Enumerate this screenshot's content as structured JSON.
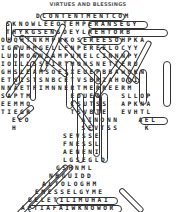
{
  "puzzle": {
    "title": "VIRTUES AND BLESSINGS",
    "type": "word-search",
    "rows": [
      {
        "x": 36,
        "y": 10,
        "text": "DCONTENTMENTCOM"
      },
      {
        "x": 6,
        "y": 18,
        "text": "SKNOWLEEOTEMPERANSEGY"
      },
      {
        "x": 6,
        "y": 26,
        "text": "THYKGSENSOEYLREHTORB"
      },
      {
        "x": 1,
        "y": 34,
        "text": "OHQHTNKMPNKOSEREESOHPKA"
      },
      {
        "x": 1,
        "y": 42,
        "text": "IGWUHMGELLFNPEREELOCYY"
      },
      {
        "x": 1,
        "y": 50,
        "text": "LUOMOWNSAMPUMELCINNNPY"
      },
      {
        "x": 1,
        "y": 58,
        "text": "IOILLSSEIRTMONSNETTERU"
      },
      {
        "x": 1,
        "y": 66,
        "text": "GHSLEAMSOEIXEUEPBBAWOKN"
      },
      {
        "x": 1,
        "y": 74,
        "text": "ETSISTSNBCETVSBRZAHOOI"
      },
      {
        "x": 1,
        "y": 82,
        "text": "NNAETFIMNNERTMERREERM"
      },
      {
        "x": 1,
        "y": 90,
        "text": "SAPTM      EDUES   SLLOP"
      },
      {
        "x": 1,
        "y": 98,
        "text": "EEMMO      ISUTSS  APKNA"
      },
      {
        "x": 1,
        "y": 106,
        "text": "TIEGR      TSVBTE  EVHTL"
      },
      {
        "x": 12,
        "y": 114,
        "text": "ECO        AINONN   AEL"
      },
      {
        "x": 12,
        "y": 122,
        "text": "H          SEVTSS    K"
      },
      {
        "x": 63,
        "y": 130,
        "text": "SEVSSE"
      },
      {
        "x": 63,
        "y": 138,
        "text": "FNESSL"
      },
      {
        "x": 63,
        "y": 146,
        "text": "AENENI"
      },
      {
        "x": 63,
        "y": 154,
        "text": "LGSEGLD"
      },
      {
        "x": 56,
        "y": 162,
        "text": "GSHNML"
      },
      {
        "x": 49,
        "y": 170,
        "text": "NBGUIDD"
      },
      {
        "x": 42,
        "y": 178,
        "text": "ALTOLOGHM"
      },
      {
        "x": 35,
        "y": 186,
        "text": "EMESSELGYME"
      },
      {
        "x": 28,
        "y": 194,
        "text": "BELETILIMUHAI"
      },
      {
        "x": 21,
        "y": 202,
        "text": "ACTIAFAIWKNOWOR"
      },
      {
        "x": 14,
        "y": 210,
        "text": "STRAEHECNAREPMETF"
      }
    ],
    "found_words": [
      "CONTENTMENT",
      "TEMPERANCE",
      "KNOWLEDGE",
      "BROTHERLY",
      "HUMILITY",
      "TEMPERANCE",
      "KINDNESS",
      "GENEROSITY",
      "PATIENCE",
      "FAITH",
      "VIRTUE",
      "GOODNESS",
      "SELFLESSNESS",
      "WISDOM",
      "HEART",
      "MEEKNESS",
      "HOLINESS",
      "LOVE"
    ],
    "rings": [
      {
        "x": 40,
        "y": 10,
        "w": 85,
        "h": 8
      },
      {
        "x": 6,
        "y": 18,
        "w": 6,
        "h": 22
      },
      {
        "x": 88,
        "y": 18,
        "w": 60,
        "h": 8
      },
      {
        "x": 12,
        "y": 26,
        "w": 45,
        "h": 8
      },
      {
        "x": 88,
        "y": 26,
        "w": 80,
        "h": 8
      },
      {
        "x": 80,
        "y": 34,
        "w": 42,
        "h": 8
      },
      {
        "x": 66,
        "y": 58,
        "w": 7,
        "h": 48
      },
      {
        "x": 94,
        "y": 66,
        "w": 7,
        "h": 46
      },
      {
        "x": 163,
        "y": 58,
        "w": 8,
        "h": 46
      },
      {
        "x": 139,
        "y": 66,
        "w": 8,
        "h": 36
      },
      {
        "x": 13,
        "y": 42,
        "w": 7,
        "h": 40
      },
      {
        "x": 30,
        "y": 58,
        "w": 6,
        "h": 40
      },
      {
        "x": 77,
        "y": 90,
        "w": 7,
        "h": 70
      },
      {
        "x": 93,
        "y": 90,
        "w": 7,
        "h": 64
      },
      {
        "x": 101,
        "y": 90,
        "w": 7,
        "h": 70
      },
      {
        "x": 140,
        "y": 114,
        "w": 28,
        "h": 8
      },
      {
        "x": 14,
        "y": 210,
        "w": 110,
        "h": 8
      },
      {
        "x": 56,
        "y": 194,
        "w": 62,
        "h": 8
      },
      {
        "x": 28,
        "y": 202,
        "w": 94,
        "h": 8
      }
    ],
    "diagonals": [
      {
        "x": 20,
        "y": 33,
        "len": 62,
        "angle": 40
      },
      {
        "x": 64,
        "y": 21,
        "len": 52,
        "angle": 115
      },
      {
        "x": 60,
        "y": 36,
        "len": 60,
        "angle": 48
      },
      {
        "x": 100,
        "y": 45,
        "len": 52,
        "angle": 42
      },
      {
        "x": 150,
        "y": 38,
        "len": 48,
        "angle": 118
      },
      {
        "x": 128,
        "y": 48,
        "len": 56,
        "angle": 125
      },
      {
        "x": 38,
        "y": 50,
        "len": 54,
        "angle": 125
      },
      {
        "x": 18,
        "y": 116,
        "len": 20,
        "angle": -40
      },
      {
        "x": 72,
        "y": 98,
        "len": 36,
        "angle": 55
      },
      {
        "x": 18,
        "y": 212,
        "len": 70,
        "angle": -45
      },
      {
        "x": 30,
        "y": 205,
        "len": 60,
        "angle": -45
      },
      {
        "x": 120,
        "y": 186,
        "len": 32,
        "angle": 45
      }
    ]
  }
}
